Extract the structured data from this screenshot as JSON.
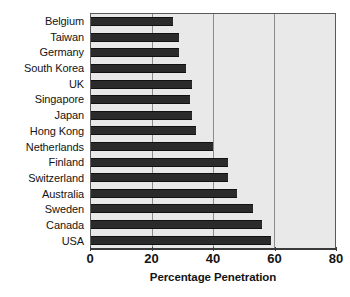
{
  "chart_data": {
    "type": "bar",
    "orientation": "horizontal",
    "title": "",
    "xlabel": "Percentage Penetration",
    "ylabel": "",
    "xlim": [
      0,
      80
    ],
    "xticks": [
      0,
      20,
      40,
      60,
      80
    ],
    "gridlines": [
      20,
      40,
      60
    ],
    "grid": true,
    "legend": null,
    "categories": [
      "Belgium",
      "Taiwan",
      "Germany",
      "South Korea",
      "UK",
      "Singapore",
      "Japan",
      "Hong Kong",
      "Netherlands",
      "Finland",
      "Switzerland",
      "Australia",
      "Sweden",
      "Canada",
      "USA"
    ],
    "values": [
      27,
      29,
      29,
      31,
      33,
      32.5,
      33,
      34.5,
      40,
      45,
      45,
      48,
      53,
      56,
      59
    ],
    "colors": {
      "bar": "#2b2b2b",
      "plot_background": "#e9e9e9",
      "grid": "#8c8c8c",
      "axis": "#3a3a3a",
      "text": "#141414",
      "page_background": "#ffffff"
    }
  }
}
